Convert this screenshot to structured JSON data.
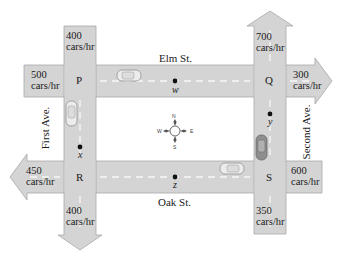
{
  "streets": {
    "elm": "Elm St.",
    "oak": "Oak St.",
    "first": "First Ave.",
    "second": "Second Ave."
  },
  "intersections": {
    "P": "P",
    "Q": "Q",
    "R": "R",
    "S": "S"
  },
  "variables": {
    "w": "w",
    "x": "x",
    "y": "y",
    "z": "z"
  },
  "flows": {
    "p_north_in": {
      "value": "400",
      "unit": "cars/hr"
    },
    "p_west_in": {
      "value": "500",
      "unit": "cars/hr"
    },
    "q_north_out": {
      "value": "700",
      "unit": "cars/hr"
    },
    "q_east_out": {
      "value": "300",
      "unit": "cars/hr"
    },
    "r_west_out": {
      "value": "450",
      "unit": "cars/hr"
    },
    "r_south_out": {
      "value": "400",
      "unit": "cars/hr"
    },
    "s_east_in": {
      "value": "600",
      "unit": "cars/hr"
    },
    "s_south_in": {
      "value": "350",
      "unit": "cars/hr"
    }
  },
  "compass": {
    "N": "N",
    "S": "S",
    "E": "E",
    "W": "W"
  },
  "colors": {
    "road": "#d4d4d4",
    "road_edge": "#a8a8a8",
    "lane": "#f4f4f4",
    "car": "#e8e8e8",
    "car_dark": "#9a9a9a"
  }
}
